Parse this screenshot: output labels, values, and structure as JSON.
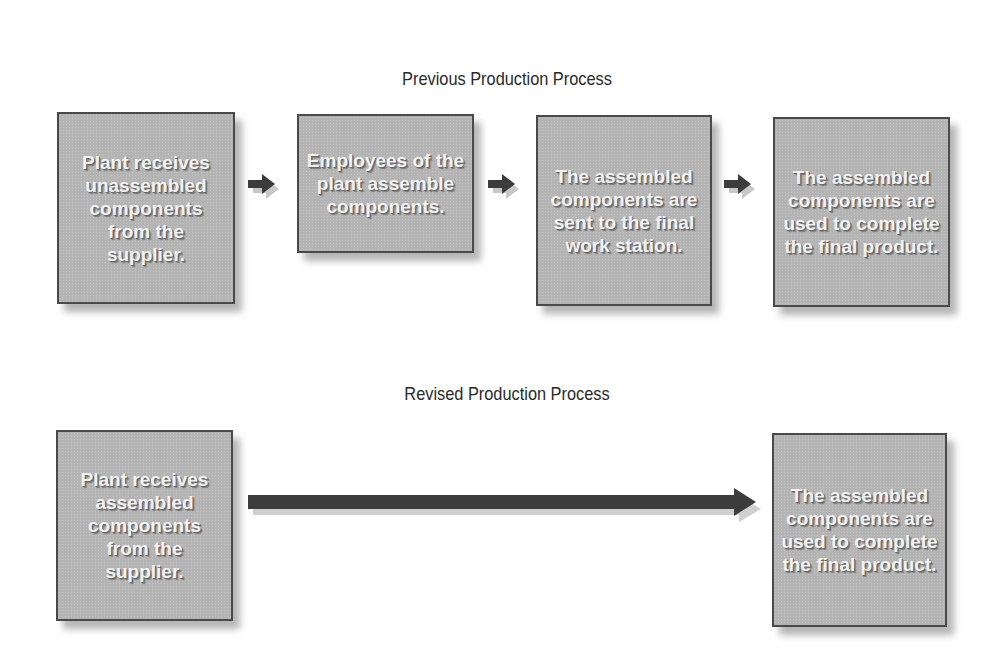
{
  "diagram": {
    "previous": {
      "title": "Previous Production Process",
      "steps": [
        {
          "label": "Plant receives unassembled components from the supplier."
        },
        {
          "label": "Employees of the plant assemble components."
        },
        {
          "label": "The assembled components are sent to the final work station."
        },
        {
          "label": "The assembled components are used to complete the final product."
        }
      ],
      "connectors": [
        "arrow-right",
        "arrow-right",
        "arrow-right"
      ]
    },
    "revised": {
      "title": "Revised Production Process",
      "steps": [
        {
          "label": "Plant receives assembled components from the supplier."
        },
        {
          "label": "The assembled components are used to complete the final product."
        }
      ],
      "connectors": [
        "long-arrow-right"
      ]
    },
    "colors": {
      "box_fill": "#b4b4b4",
      "box_border": "#4a4a4a",
      "arrow_fill": "#3c3c3c",
      "text": "#f2f2f2"
    }
  }
}
